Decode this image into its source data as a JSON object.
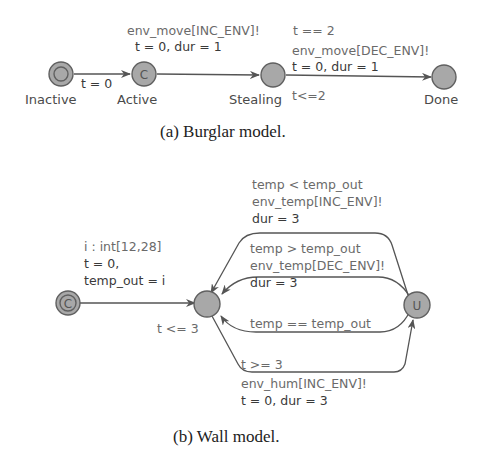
{
  "burglar": {
    "caption": "(a)  Burglar model.",
    "states": {
      "inactive": "Inactive",
      "active": "Active",
      "active_mark": "C",
      "stealing": "Stealing",
      "done": "Done"
    },
    "edges": {
      "inactive_active": {
        "update": "t = 0"
      },
      "active_stealing": {
        "sync": "env_move[INC_ENV]!",
        "update": "t = 0, dur = 1"
      },
      "stealing_done": {
        "guard": "t == 2",
        "sync": "env_move[DEC_ENV]!",
        "update": "t = 0, dur = 1"
      }
    },
    "invariant_stealing": "t<=2"
  },
  "wall": {
    "caption": "(b)  Wall model.",
    "init_mark": "C",
    "urgent_mark": "U",
    "edges": {
      "init": {
        "select": "i : int[12,28]",
        "update1": "t = 0,",
        "update2": "temp_out = i"
      },
      "inc_temp": {
        "guard": "temp < temp_out",
        "sync": "env_temp[INC_ENV]!",
        "update": "dur = 3"
      },
      "dec_temp": {
        "guard": "temp > temp_out",
        "sync": "env_temp[DEC_ENV]!",
        "update": "dur = 3"
      },
      "eq_temp": {
        "guard": "temp == temp_out"
      },
      "hum": {
        "guard": "t >= 3",
        "sync": "env_hum[INC_ENV]!",
        "update": "t = 0, dur = 3"
      }
    },
    "invariant": "t <= 3"
  }
}
